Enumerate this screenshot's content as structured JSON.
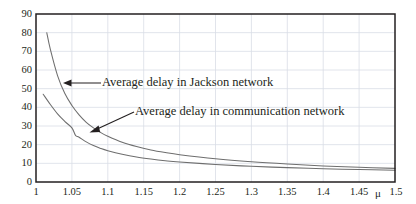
{
  "chart_data": {
    "type": "line",
    "title": "",
    "xlabel": "μ",
    "ylabel": "",
    "xlim": [
      1,
      1.5
    ],
    "ylim": [
      0,
      90
    ],
    "grid": true,
    "legend_position": "inline-annotations",
    "xticks": [
      "1",
      "1.05",
      "1.1",
      "1.15",
      "1.2",
      "1.25",
      "1.3",
      "1.35",
      "1.4",
      "1.45",
      "1.5"
    ],
    "xtick_values": [
      1,
      1.05,
      1.1,
      1.15,
      1.2,
      1.25,
      1.3,
      1.35,
      1.4,
      1.45,
      1.5
    ],
    "yticks": [
      "0",
      "10",
      "20",
      "30",
      "40",
      "50",
      "60",
      "70",
      "80",
      "90"
    ],
    "ytick_values": [
      0,
      10,
      20,
      30,
      40,
      50,
      60,
      70,
      80,
      90
    ],
    "series": [
      {
        "name": "Average delay in Jackson network",
        "x": [
          1.015,
          1.02,
          1.03,
          1.04,
          1.05,
          1.06,
          1.07,
          1.08,
          1.09,
          1.1,
          1.12,
          1.14,
          1.16,
          1.18,
          1.2,
          1.25,
          1.3,
          1.35,
          1.4,
          1.45,
          1.5
        ],
        "values": [
          80,
          71,
          57,
          47.5,
          41,
          36,
          32,
          29,
          26.5,
          24.5,
          21.3,
          19,
          17.2,
          15.8,
          14.6,
          12.4,
          10.8,
          9.6,
          8.6,
          7.9,
          7.3
        ]
      },
      {
        "name": "Average delay in communication network",
        "x": [
          1.01,
          1.02,
          1.03,
          1.04,
          1.05,
          1.055,
          1.06,
          1.07,
          1.08,
          1.09,
          1.1,
          1.12,
          1.14,
          1.16,
          1.18,
          1.2,
          1.25,
          1.3,
          1.35,
          1.4,
          1.45,
          1.5
        ],
        "values": [
          47,
          41.5,
          36.5,
          32.5,
          29,
          25,
          24,
          21.5,
          19.5,
          18,
          16.8,
          14.9,
          13.4,
          12.3,
          11.4,
          10.7,
          9.4,
          8.4,
          7.7,
          7.1,
          6.7,
          6.3
        ]
      }
    ],
    "annotations": [
      {
        "text": "Average delay in Jackson network",
        "arrow": "points-left-to-upper-curve"
      },
      {
        "text": "Average delay in communication network",
        "arrow": "points-down-left-to-lower-curve"
      }
    ],
    "colors": {
      "curve": "#6e6e6e",
      "frame": "#231f20",
      "grid": "#d9dde6",
      "text": "#231f20",
      "background": "#ffffff"
    }
  }
}
